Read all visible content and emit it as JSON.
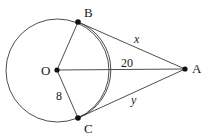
{
  "figure": {
    "background_color": "#ffffff",
    "stroke_color": "#3a3a3a",
    "point_color": "#111111",
    "label_color": "#1a1a1a",
    "width": 209,
    "height": 137
  },
  "points": [
    {
      "id": "O",
      "label": "O",
      "x": 57,
      "y": 70,
      "label_x": 41,
      "label_y": 64,
      "dot": true
    },
    {
      "id": "B",
      "label": "B",
      "x": 78,
      "y": 22,
      "label_x": 84,
      "label_y": 6,
      "dot": true
    },
    {
      "id": "C",
      "label": "C",
      "x": 78,
      "y": 118,
      "label_x": 84,
      "label_y": 122,
      "dot": true
    },
    {
      "id": "A",
      "label": "A",
      "x": 185,
      "y": 69,
      "label_x": 192,
      "label_y": 62,
      "dot": true
    }
  ],
  "circle": {
    "center_x": 57.5,
    "center_y": 70.5,
    "radius": 51.5
  },
  "arc": {
    "description": "arc from B to C passing right of center",
    "start_x": 78,
    "start_y": 22,
    "end_x": 78,
    "end_y": 118,
    "radius": 51.5
  },
  "segments": [
    {
      "id": "OB",
      "from": "O",
      "to": "B",
      "x1": 57,
      "y1": 70,
      "x2": 78,
      "y2": 22
    },
    {
      "id": "OC",
      "from": "O",
      "to": "C",
      "x1": 57,
      "y1": 70,
      "x2": 78,
      "y2": 118
    },
    {
      "id": "OA",
      "from": "O",
      "to": "A",
      "x1": 57,
      "y1": 70,
      "x2": 185,
      "y2": 69
    },
    {
      "id": "BA",
      "from": "B",
      "to": "A",
      "x1": 78,
      "y1": 22,
      "x2": 185,
      "y2": 69
    },
    {
      "id": "CA",
      "from": "C",
      "to": "A",
      "x1": 78,
      "y1": 118,
      "x2": 185,
      "y2": 69
    }
  ],
  "annotations": [
    {
      "id": "seg-oa-length",
      "text": "20",
      "x": 121,
      "y": 57,
      "style": "measure",
      "labels": "OA"
    },
    {
      "id": "seg-ba-length",
      "text": "x",
      "x": 134,
      "y": 33,
      "style": "var",
      "labels": "BA"
    },
    {
      "id": "seg-ca-length",
      "text": "y",
      "x": 131,
      "y": 94,
      "style": "var",
      "labels": "CA"
    },
    {
      "id": "seg-oc-length",
      "text": "8",
      "x": 56,
      "y": 90,
      "style": "measure",
      "labels": "OC"
    }
  ]
}
